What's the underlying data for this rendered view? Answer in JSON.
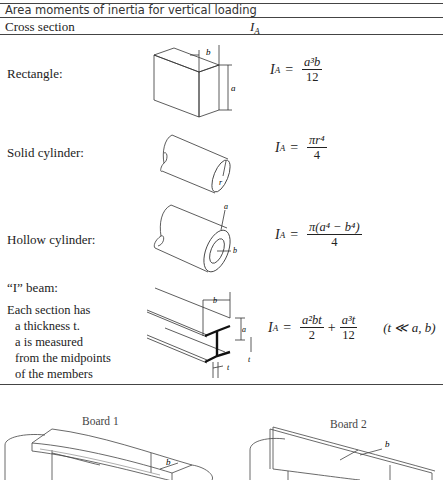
{
  "table": {
    "title": "Area moments of inertia for vertical loading",
    "headers": {
      "cross_section": "Cross section",
      "ia": "I",
      "ia_sub": "A"
    },
    "rows": [
      {
        "label": "Rectangle:",
        "formula_lhs": "I",
        "formula_sub": "A",
        "eq": "=",
        "numerator": "a³b",
        "denominator": "12",
        "diagram_labels": {
          "b": "b",
          "a": "a"
        }
      },
      {
        "label": "Solid cylinder:",
        "formula_lhs": "I",
        "formula_sub": "A",
        "eq": "=",
        "numerator": "πr⁴",
        "denominator": "4",
        "diagram_labels": {
          "r": "r"
        }
      },
      {
        "label": "Hollow cylinder:",
        "formula_lhs": "I",
        "formula_sub": "A",
        "eq": "=",
        "numerator": "π(a⁴ − b⁴)",
        "denominator": "4",
        "diagram_labels": {
          "a": "a",
          "b": "b"
        }
      },
      {
        "label": "“I” beam:",
        "note_lines": [
          "Each section has",
          "a thickness t.",
          "a is measured",
          "from the midpoints",
          "of the members"
        ],
        "formula_lhs": "I",
        "formula_sub": "A",
        "eq": "=",
        "term1_num": "a²bt",
        "term1_den": "2",
        "plus": "+",
        "term2_num": "a³t",
        "term2_den": "12",
        "condition": "(t ≪ a, b)",
        "diagram_labels": {
          "b": "b",
          "a": "a",
          "t1": "t",
          "t2": "t"
        }
      }
    ]
  },
  "illustrations": {
    "board1": {
      "label": "Board 1",
      "dim": "b"
    },
    "board2": {
      "label": "Board 2",
      "dim": "b"
    }
  }
}
